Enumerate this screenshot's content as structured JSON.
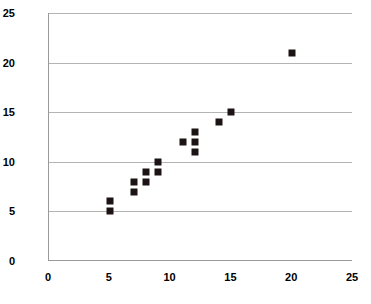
{
  "chart_data": {
    "type": "scatter",
    "title": "",
    "subtitle": "",
    "xlabel": "",
    "ylabel": "",
    "xlim": [
      0,
      25
    ],
    "ylim": [
      0,
      25
    ],
    "xticks": [
      0,
      5,
      10,
      15,
      20,
      25
    ],
    "yticks": [
      0,
      5,
      10,
      15,
      20,
      25
    ],
    "xtick_labels": [
      "0",
      "5",
      "10",
      "15",
      "20",
      "25"
    ],
    "ytick_labels": [
      "0",
      "5",
      "10",
      "15",
      "20",
      "25"
    ],
    "grid": "horizontal",
    "legend": "none",
    "marker": "square",
    "marker_color": "#1c1414",
    "marker_size_px": 7,
    "gridline_color": "#b4b4b4",
    "axis_color": "#9a9a9a",
    "background_color": "#ffffff",
    "series": [
      {
        "name": "data",
        "points": [
          {
            "x": 5,
            "y": 5
          },
          {
            "x": 5,
            "y": 6
          },
          {
            "x": 7,
            "y": 7
          },
          {
            "x": 7,
            "y": 8
          },
          {
            "x": 8,
            "y": 8
          },
          {
            "x": 8,
            "y": 9
          },
          {
            "x": 9,
            "y": 9
          },
          {
            "x": 9,
            "y": 10
          },
          {
            "x": 11,
            "y": 12
          },
          {
            "x": 12,
            "y": 11
          },
          {
            "x": 12,
            "y": 12
          },
          {
            "x": 12,
            "y": 13
          },
          {
            "x": 14,
            "y": 14
          },
          {
            "x": 15,
            "y": 15
          },
          {
            "x": 20,
            "y": 21
          }
        ]
      }
    ]
  }
}
